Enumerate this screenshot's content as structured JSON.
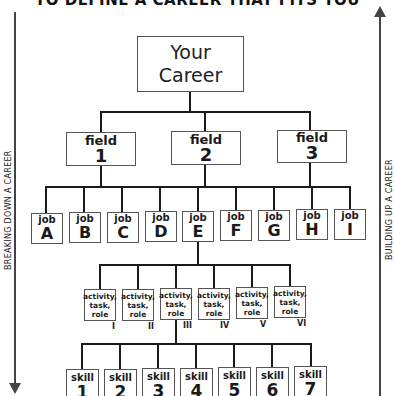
{
  "title": "TO DEFINE A CAREER THAT FITS YOU",
  "side_labels": {
    "left": "BREAKING DOWN A CAREER",
    "right": "BUILDING UP A CAREER"
  },
  "career": {
    "line1": "Your",
    "line2": "Career"
  },
  "fields": [
    {
      "label": "field",
      "num": "1"
    },
    {
      "label": "field",
      "num": "2"
    },
    {
      "label": "field",
      "num": "3"
    }
  ],
  "jobs": [
    {
      "label": "job",
      "letter": "A"
    },
    {
      "label": "job",
      "letter": "B"
    },
    {
      "label": "job",
      "letter": "C"
    },
    {
      "label": "job",
      "letter": "D"
    },
    {
      "label": "job",
      "letter": "E"
    },
    {
      "label": "job",
      "letter": "F"
    },
    {
      "label": "job",
      "letter": "G"
    },
    {
      "label": "job",
      "letter": "H"
    },
    {
      "label": "job",
      "letter": "I"
    }
  ],
  "activities": [
    {
      "l1": "activity,",
      "l2": "task,",
      "l3": "role",
      "numeral": "I"
    },
    {
      "l1": "activity,",
      "l2": "task,",
      "l3": "role",
      "numeral": "II"
    },
    {
      "l1": "activity,",
      "l2": "task,",
      "l3": "role",
      "numeral": "III"
    },
    {
      "l1": "activity,",
      "l2": "task,",
      "l3": "role",
      "numeral": "IV"
    },
    {
      "l1": "activity,",
      "l2": "task,",
      "l3": "role",
      "numeral": "V"
    },
    {
      "l1": "activity,",
      "l2": "task,",
      "l3": "role",
      "numeral": "VI"
    }
  ],
  "skills": [
    {
      "label": "skill",
      "num": "1"
    },
    {
      "label": "skill",
      "num": "2"
    },
    {
      "label": "skill",
      "num": "3"
    },
    {
      "label": "skill",
      "num": "4"
    },
    {
      "label": "skill",
      "num": "5"
    },
    {
      "label": "skill",
      "num": "6"
    },
    {
      "label": "skill",
      "num": "7"
    }
  ]
}
